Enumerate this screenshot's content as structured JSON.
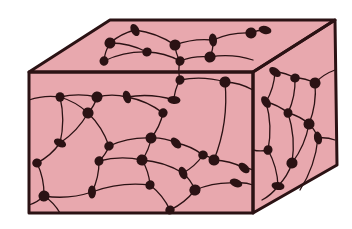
{
  "figure": {
    "title": "",
    "colors": {
      "background": "#ffffff",
      "fill": "#e8a8ae",
      "ink": "#2b1214"
    },
    "box": {
      "front": [
        [
          29,
          72
        ],
        [
          253,
          72
        ],
        [
          253,
          213
        ],
        [
          29,
          213
        ]
      ],
      "top": [
        [
          29,
          72
        ],
        [
          110,
          20
        ],
        [
          335,
          20
        ],
        [
          253,
          72
        ]
      ],
      "side": [
        [
          253,
          72
        ],
        [
          335,
          20
        ],
        [
          337,
          165
        ],
        [
          253,
          213
        ]
      ]
    },
    "nodes": [
      [
        60,
        97
      ],
      [
        97,
        97
      ],
      [
        127,
        97
      ],
      [
        180,
        80
      ],
      [
        225,
        82
      ],
      [
        174,
        100
      ],
      [
        163,
        113
      ],
      [
        88,
        113
      ],
      [
        60,
        143
      ],
      [
        109,
        146
      ],
      [
        151,
        138
      ],
      [
        176,
        143
      ],
      [
        203,
        155
      ],
      [
        142,
        160
      ],
      [
        183,
        173
      ],
      [
        99,
        161
      ],
      [
        44,
        196
      ],
      [
        92,
        192
      ],
      [
        150,
        185
      ],
      [
        195,
        190
      ],
      [
        236,
        183
      ],
      [
        170,
        210
      ],
      [
        214,
        160
      ],
      [
        244,
        168
      ],
      [
        37,
        163
      ],
      [
        110,
        43
      ],
      [
        135,
        30
      ],
      [
        104,
        61
      ],
      [
        175,
        45
      ],
      [
        213,
        40
      ],
      [
        180,
        61
      ],
      [
        210,
        57
      ],
      [
        265,
        30
      ],
      [
        147,
        52
      ],
      [
        251,
        33
      ],
      [
        275,
        72
      ],
      [
        295,
        78
      ],
      [
        315,
        83
      ],
      [
        266,
        102
      ],
      [
        288,
        113
      ],
      [
        309,
        124
      ],
      [
        318,
        138
      ],
      [
        268,
        150
      ],
      [
        292,
        163
      ],
      [
        278,
        186
      ]
    ],
    "strands": [
      [
        [
          29,
          100
        ],
        [
          60,
          97
        ],
        [
          97,
          97
        ],
        [
          127,
          97
        ],
        [
          174,
          100
        ]
      ],
      [
        [
          60,
          97
        ],
        [
          88,
          113
        ],
        [
          109,
          146
        ],
        [
          99,
          161
        ],
        [
          92,
          192
        ],
        [
          44,
          196
        ],
        [
          29,
          205
        ]
      ],
      [
        [
          60,
          97
        ],
        [
          60,
          143
        ],
        [
          37,
          163
        ],
        [
          44,
          196
        ]
      ],
      [
        [
          97,
          97
        ],
        [
          88,
          113
        ],
        [
          60,
          143
        ]
      ],
      [
        [
          127,
          97
        ],
        [
          163,
          113
        ],
        [
          151,
          138
        ],
        [
          176,
          143
        ],
        [
          203,
          155
        ],
        [
          214,
          160
        ],
        [
          244,
          168
        ],
        [
          253,
          170
        ]
      ],
      [
        [
          174,
          100
        ],
        [
          180,
          80
        ],
        [
          180,
          61
        ],
        [
          175,
          45
        ]
      ],
      [
        [
          180,
          80
        ],
        [
          225,
          82
        ],
        [
          253,
          90
        ]
      ],
      [
        [
          225,
          82
        ],
        [
          214,
          160
        ]
      ],
      [
        [
          109,
          146
        ],
        [
          151,
          138
        ],
        [
          142,
          160
        ],
        [
          150,
          185
        ],
        [
          170,
          210
        ]
      ],
      [
        [
          142,
          160
        ],
        [
          183,
          173
        ],
        [
          195,
          190
        ],
        [
          236,
          183
        ],
        [
          253,
          185
        ]
      ],
      [
        [
          99,
          161
        ],
        [
          142,
          160
        ]
      ],
      [
        [
          92,
          192
        ],
        [
          150,
          185
        ]
      ],
      [
        [
          195,
          190
        ],
        [
          170,
          210
        ]
      ],
      [
        [
          44,
          196
        ],
        [
          60,
          213
        ]
      ],
      [
        [
          203,
          155
        ],
        [
          183,
          173
        ]
      ],
      [
        [
          104,
          61
        ],
        [
          110,
          43
        ],
        [
          135,
          30
        ],
        [
          175,
          45
        ],
        [
          213,
          40
        ],
        [
          251,
          33
        ],
        [
          265,
          30
        ]
      ],
      [
        [
          104,
          61
        ],
        [
          147,
          52
        ],
        [
          180,
          61
        ],
        [
          210,
          57
        ],
        [
          253,
          60
        ]
      ],
      [
        [
          110,
          43
        ],
        [
          147,
          52
        ]
      ],
      [
        [
          213,
          40
        ],
        [
          210,
          57
        ]
      ],
      [
        [
          275,
          72
        ],
        [
          295,
          78
        ],
        [
          315,
          83
        ],
        [
          335,
          70
        ]
      ],
      [
        [
          266,
          102
        ],
        [
          288,
          113
        ],
        [
          309,
          124
        ],
        [
          318,
          138
        ],
        [
          335,
          140
        ]
      ],
      [
        [
          275,
          72
        ],
        [
          266,
          102
        ],
        [
          268,
          150
        ],
        [
          278,
          186
        ],
        [
          262,
          200
        ]
      ],
      [
        [
          295,
          78
        ],
        [
          288,
          113
        ],
        [
          292,
          163
        ],
        [
          278,
          186
        ]
      ],
      [
        [
          315,
          83
        ],
        [
          309,
          124
        ],
        [
          292,
          163
        ]
      ],
      [
        [
          268,
          150
        ],
        [
          253,
          150
        ]
      ],
      [
        [
          318,
          138
        ],
        [
          300,
          190
        ]
      ]
    ]
  }
}
